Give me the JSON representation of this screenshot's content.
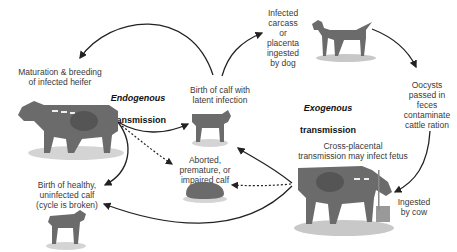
{
  "diagram": {
    "titles": {
      "endogenous": {
        "line1": "Endogenous",
        "line2": "transmission"
      },
      "exogenous": {
        "line1": "Exogenous",
        "line2": "transmission"
      }
    },
    "nodes": {
      "maturation": "Maturation & breeding\nof infected heifer",
      "birth_latent": "Birth of calf with\nlatent infection",
      "dog": "Infected\ncarcass\nor\nplacenta\ningested\nby dog",
      "oocysts": "Oocysts\npassed in\nfeces\ncontaminate\ncattle ration",
      "ingested": "Ingested\nby cow",
      "cross_placental": "Cross-placental\ntransmission may infect fetus",
      "aborted": "Aborted,\npremature, or\nimpaired calf",
      "healthy": "Birth of healthy,\nuninfected calf\n(cycle is broken)"
    },
    "images": [
      "infected-heifer",
      "latent-calf",
      "dog",
      "infected-cow",
      "aborted-calf",
      "healthy-calf"
    ],
    "colors": {
      "animal": "#6b6b6b",
      "shadow": "#c8c8c8",
      "arrow": "#222222"
    }
  }
}
